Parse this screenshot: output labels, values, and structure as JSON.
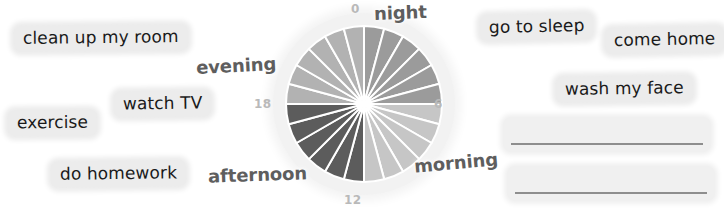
{
  "worksheet": {
    "title": "Daily routine 24-hour clock",
    "colors": {
      "chip_background": "#ececec",
      "period_label": "#5e5e5e",
      "tick_label": "#b9b9b9",
      "wedge_separator": "#ffffff",
      "blank_rule": "#8e8e8e",
      "halo": "#f2f2f2"
    }
  },
  "word_bank": {
    "left": [
      {
        "label": "clean up my room",
        "x": 14,
        "y": 25,
        "rotate": -0.6,
        "size": 17
      },
      {
        "label": "watch TV",
        "x": 114,
        "y": 91,
        "rotate": -0.8,
        "size": 17
      },
      {
        "label": "exercise",
        "x": 8,
        "y": 110,
        "rotate": -0.5,
        "size": 17
      },
      {
        "label": "do homework",
        "x": 51,
        "y": 161,
        "rotate": -0.7,
        "size": 17
      }
    ],
    "right": [
      {
        "label": "go to sleep",
        "x": 480,
        "y": 14,
        "rotate": -1.2,
        "size": 17
      },
      {
        "label": "come home",
        "x": 605,
        "y": 27,
        "rotate": -1.0,
        "size": 17
      },
      {
        "label": "wash my face",
        "x": 556,
        "y": 76,
        "rotate": -0.8,
        "size": 17
      }
    ]
  },
  "answer_blanks": [
    {
      "name": "answer-line-1",
      "x": 503,
      "y": 117,
      "width": 208,
      "height": 35
    },
    {
      "name": "answer-line-2",
      "x": 507,
      "y": 166,
      "width": 208,
      "height": 35
    }
  ],
  "chart_data": {
    "type": "pie",
    "subtitle": "",
    "xlabel": "",
    "ylabel": "",
    "total_slices": 24,
    "slice_value": 1,
    "units": "hours",
    "start_angle_deg": 0,
    "direction": "clockwise",
    "center": {
      "x": 91,
      "y": 91
    },
    "radius": 78,
    "separator_width": 2,
    "categories": [
      "0",
      "1",
      "2",
      "3",
      "4",
      "5",
      "6",
      "7",
      "8",
      "9",
      "10",
      "11",
      "12",
      "13",
      "14",
      "15",
      "16",
      "17",
      "18",
      "19",
      "20",
      "21",
      "22",
      "23"
    ],
    "values": [
      1,
      1,
      1,
      1,
      1,
      1,
      1,
      1,
      1,
      1,
      1,
      1,
      1,
      1,
      1,
      1,
      1,
      1,
      1,
      1,
      1,
      1,
      1,
      1
    ],
    "slice_colors": [
      "#9b9b9b",
      "#9b9b9b",
      "#9b9b9b",
      "#9b9b9b",
      "#9b9b9b",
      "#9b9b9b",
      "#c6c6c6",
      "#c6c6c6",
      "#c6c6c6",
      "#c6c6c6",
      "#c6c6c6",
      "#c6c6c6",
      "#5c5c5c",
      "#5c5c5c",
      "#5c5c5c",
      "#5c5c5c",
      "#5c5c5c",
      "#5c5c5c",
      "#b2b2b2",
      "#b2b2b2",
      "#b2b2b2",
      "#b2b2b2",
      "#b2b2b2",
      "#b2b2b2"
    ],
    "groups": [
      {
        "name": "night",
        "hours": [
          0,
          6
        ],
        "color": "#9b9b9b"
      },
      {
        "name": "morning",
        "hours": [
          6,
          12
        ],
        "color": "#c6c6c6"
      },
      {
        "name": "afternoon",
        "hours": [
          12,
          18
        ],
        "color": "#5c5c5c"
      },
      {
        "name": "evening",
        "hours": [
          18,
          24
        ],
        "color": "#b2b2b2"
      }
    ],
    "tick_labels": [
      {
        "label": "0",
        "hour": 0,
        "x": 351,
        "y": 2,
        "name": "hour-tick-0"
      },
      {
        "label": "6",
        "hour": 6,
        "x": 434,
        "y": 97,
        "name": "hour-tick-6"
      },
      {
        "label": "12",
        "hour": 12,
        "x": 344,
        "y": 193,
        "name": "hour-tick-12"
      },
      {
        "label": "18",
        "hour": 18,
        "x": 254,
        "y": 97,
        "name": "hour-tick-18"
      }
    ],
    "period_labels": [
      {
        "label": "night",
        "x": 374,
        "y": 2,
        "rotate": -2,
        "name": "period-label-night"
      },
      {
        "label": "morning",
        "x": 414,
        "y": 152,
        "rotate": -5,
        "name": "period-label-morning"
      },
      {
        "label": "afternoon",
        "x": 208,
        "y": 164,
        "rotate": -2,
        "name": "period-label-afternoon"
      },
      {
        "label": "evening",
        "x": 196,
        "y": 55,
        "rotate": -3,
        "name": "period-label-evening"
      }
    ],
    "legend_position": "none",
    "grid": false
  }
}
